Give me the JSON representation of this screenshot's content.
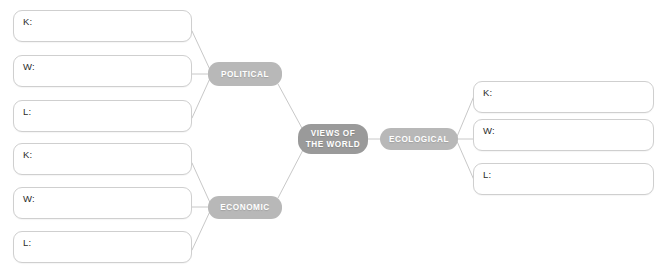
{
  "diagram": {
    "type": "mind-map",
    "colors": {
      "center_node_fill": "#9a9a9a",
      "branch_node_fill": "#b8b8b8",
      "node_text": "#ffffff",
      "box_border": "#cfcfcf",
      "box_fill": "#ffffff",
      "box_label_text": "#2b2b2b",
      "connector_line": "#c8c8c8",
      "background": "#ffffff"
    },
    "center_node": {
      "line1": "VIEWS OF",
      "line2": "THE WORLD"
    },
    "branches": [
      {
        "id": "political",
        "label": "POLITICAL",
        "side": "left",
        "boxes": [
          {
            "label": "K:",
            "value": ""
          },
          {
            "label": "W:",
            "value": ""
          },
          {
            "label": "L:",
            "value": ""
          }
        ]
      },
      {
        "id": "economic",
        "label": "ECONOMIC",
        "side": "left",
        "boxes": [
          {
            "label": "K:",
            "value": ""
          },
          {
            "label": "W:",
            "value": ""
          },
          {
            "label": "L:",
            "value": ""
          }
        ]
      },
      {
        "id": "ecological",
        "label": "ECOLOGICAL",
        "side": "right",
        "boxes": [
          {
            "label": "K:",
            "value": ""
          },
          {
            "label": "W:",
            "value": ""
          },
          {
            "label": "L:",
            "value": ""
          }
        ]
      }
    ]
  }
}
